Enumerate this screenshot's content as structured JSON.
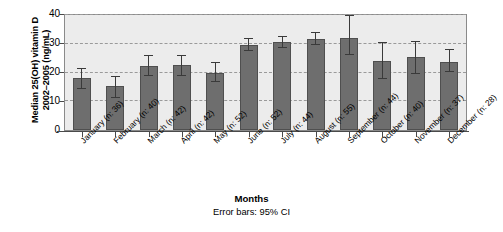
{
  "chart_data": {
    "type": "bar",
    "title": "",
    "xlabel": "Months",
    "ylabel": "Median 25(OH) vitamin D 2002–2005 (ng/mL)",
    "ylabel_line1": "Median 25(OH) vitamin D",
    "ylabel_line2": "2002–2005 (ng/mL)",
    "ylim": [
      0,
      40
    ],
    "yticks": [
      0,
      10,
      20,
      30,
      40
    ],
    "ytick_labels": [
      "0",
      "10",
      "20",
      "30",
      "40"
    ],
    "grid": true,
    "grid_style": "dashed",
    "legend": "none",
    "error_note": "Error bars: 95% CI",
    "error_type": "95% CI",
    "categories": [
      "January (n: 36)",
      "February (n: 40)",
      "March (n: 42)",
      "April (n: 42)",
      "May (n: 52)",
      "June (n: 52)",
      "July (n: 44)",
      "August (n: 55)",
      "September (n: 44)",
      "October (n: 40)",
      "November (n: 37)",
      "December (n: 28)"
    ],
    "months": [
      "January",
      "February",
      "March",
      "April",
      "May",
      "June",
      "July",
      "August",
      "September",
      "October",
      "November",
      "December"
    ],
    "sample_sizes": [
      36,
      40,
      42,
      42,
      52,
      52,
      44,
      55,
      44,
      40,
      37,
      28
    ],
    "values": [
      18.0,
      15.2,
      22.4,
      22.6,
      19.8,
      29.5,
      30.5,
      31.8,
      32.0,
      24.0,
      25.5,
      23.8
    ],
    "ci_lower": [
      14.3,
      11.3,
      18.8,
      18.8,
      16.8,
      27.6,
      28.4,
      29.7,
      26.2,
      17.9,
      19.4,
      20.2
    ],
    "ci_upper": [
      21.3,
      18.3,
      25.6,
      25.8,
      23.3,
      31.5,
      32.5,
      33.8,
      39.6,
      30.2,
      30.7,
      27.8
    ],
    "colors": {
      "bar_fill": "#6e6e6e",
      "bar_edge": "#4f4f4f",
      "plot_background": "#ececec",
      "gridline": "#9a9a9a",
      "axis": "#4a4a4a",
      "error_bar": "#3a3a3a"
    }
  }
}
